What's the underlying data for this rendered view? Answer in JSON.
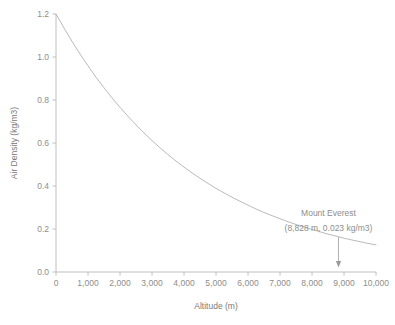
{
  "chart_data": {
    "type": "line",
    "title": "",
    "xlabel": "Altitude (m)",
    "ylabel": "Air Density (kg/m3)",
    "xlim": [
      0,
      10000
    ],
    "ylim": [
      0,
      1.2
    ],
    "grid": false,
    "legend": "none",
    "x_ticks": [
      0,
      1000,
      2000,
      3000,
      4000,
      5000,
      6000,
      7000,
      8000,
      9000,
      10000
    ],
    "x_tick_labels": [
      "0",
      "1,000",
      "2,000",
      "3,000",
      "4,000",
      "5,000",
      "6,000",
      "7,000",
      "8,000",
      "9,000",
      "10,000"
    ],
    "y_ticks": [
      0.0,
      0.2,
      0.4,
      0.6,
      0.8,
      1.0,
      1.2
    ],
    "y_tick_labels": [
      "0.0",
      "0.2",
      "0.4",
      "0.6",
      "0.8",
      "1.0",
      "1.2"
    ],
    "series": [
      {
        "name": "Air Density",
        "color": "#b2b2b2",
        "x": [
          0,
          250,
          500,
          750,
          1000,
          1250,
          1500,
          1750,
          2000,
          2250,
          2500,
          2750,
          3000,
          3250,
          3500,
          3750,
          4000,
          4250,
          4500,
          4750,
          5000,
          5250,
          5500,
          5750,
          6000,
          6250,
          6500,
          6750,
          7000,
          7250,
          7500,
          7750,
          8000,
          8250,
          8500,
          8750,
          8828,
          9000,
          9250,
          9500,
          9750,
          10000
        ],
        "values": [
          1.2,
          1.135,
          1.073,
          1.014,
          0.959,
          0.906,
          0.857,
          0.81,
          0.766,
          0.724,
          0.684,
          0.647,
          0.611,
          0.578,
          0.546,
          0.516,
          0.488,
          0.461,
          0.436,
          0.412,
          0.389,
          0.368,
          0.348,
          0.329,
          0.311,
          0.293,
          0.277,
          0.262,
          0.248,
          0.234,
          0.221,
          0.209,
          0.198,
          0.187,
          0.176,
          0.167,
          0.164,
          0.157,
          0.149,
          0.141,
          0.133,
          0.126
        ]
      }
    ],
    "annotations": [
      {
        "name": "mount-everest",
        "label_line1": "Mount Everest",
        "label_line2": "(8,828 m, 0.023 kg/m3)",
        "x": 8828,
        "y": 0.023
      }
    ]
  }
}
